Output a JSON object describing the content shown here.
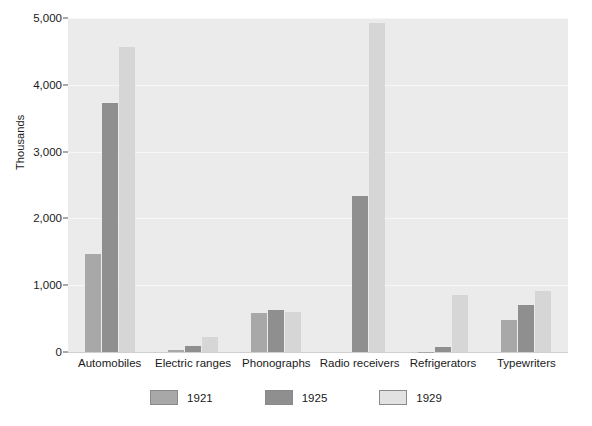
{
  "chart_data": {
    "type": "bar",
    "title": "",
    "xlabel": "",
    "ylabel": "Thousands",
    "ylim": [
      0,
      5000
    ],
    "ytick_labels": [
      "0",
      "1,000",
      "2,000",
      "3,000",
      "4,000",
      "5,000"
    ],
    "ytick_values": [
      0,
      1000,
      2000,
      3000,
      4000,
      5000
    ],
    "grid": true,
    "legend_position": "bottom",
    "categories": [
      "Automobiles",
      "Electric ranges",
      "Phonographs",
      "Radio receivers",
      "Refrigerators",
      "Typewriters"
    ],
    "series": [
      {
        "name": "1921",
        "color": "#a8a8a8",
        "values": [
          1470,
          30,
          580,
          0,
          5,
          475
        ]
      },
      {
        "name": "1925",
        "color": "#8f8f8f",
        "values": [
          3730,
          90,
          630,
          2330,
          75,
          705
        ]
      },
      {
        "name": "1929",
        "color": "#d6d6d6",
        "values": [
          4570,
          230,
          600,
          4930,
          850,
          915
        ]
      }
    ]
  },
  "legend": {
    "items": [
      {
        "label": "1921",
        "swatch": "s1921"
      },
      {
        "label": "1925",
        "swatch": "s1925"
      },
      {
        "label": "1929",
        "swatch": "s1929"
      }
    ]
  },
  "colors": {
    "plot_background": "#ebebeb",
    "gridline": "#f7f7f7",
    "series_1921": "#a8a8a8",
    "series_1925": "#8f8f8f",
    "series_1929": "#d6d6d6",
    "text": "#1a1a1a"
  }
}
